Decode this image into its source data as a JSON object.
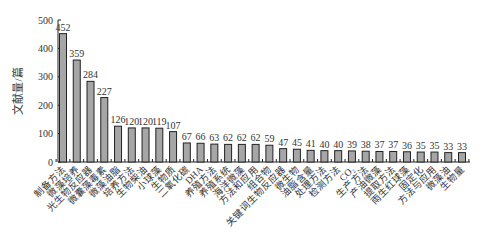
{
  "chart_data": {
    "type": "bar",
    "title": "",
    "xlabel": "",
    "ylabel": "文献量/篇",
    "ylim": [
      0,
      500
    ],
    "yticks": [
      0,
      100,
      200,
      300,
      400,
      500
    ],
    "grid": false,
    "legend": null,
    "bar_color": "#a6a6a6",
    "bar_edge_color": "#222222",
    "categories": [
      "制备方法",
      "微藻培养",
      "光生物反应器",
      "微囊藻毒素",
      "微藻油脂",
      "培养方法",
      "生物柴油",
      "小球藻",
      "生物质",
      "二氧化碳",
      "DHA",
      "养殖方法",
      "养殖系统",
      "海洋微藻",
      "方法和应用",
      "组合物",
      "关键词生物反应器",
      "微生物",
      "油脂含量",
      "处理方法",
      "检测方法",
      "CO₂",
      "生产方法",
      "产油微藻",
      "提取方法",
      "雨生红球藻",
      "固定化",
      "方法与应用",
      "微藻油",
      "生物量"
    ],
    "values": [
      452,
      359,
      284,
      227,
      126,
      120,
      120,
      119,
      107,
      67,
      66,
      63,
      62,
      62,
      62,
      59,
      47,
      45,
      41,
      40,
      40,
      39,
      38,
      37,
      37,
      36,
      35,
      35,
      33,
      33
    ]
  }
}
